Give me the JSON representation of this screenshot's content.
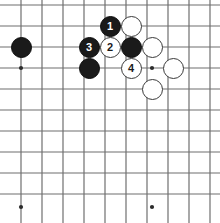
{
  "diagram": {
    "kind": "go-board-diagram",
    "title": "",
    "board": {
      "width_px": 220,
      "height_px": 223,
      "grid_spacing_px": 21,
      "stone_diameter_px": 21,
      "origin_x_px": 21,
      "origin_y_px": 5,
      "columns": 10,
      "rows": 10,
      "background_color": "#ffffff",
      "line_color": "#6f6f6f",
      "line_width_px": 1.2
    },
    "star_points": [
      {
        "name": "star-point-left",
        "cx": 21,
        "cy": 68
      },
      {
        "name": "star-point-center",
        "cx": 152,
        "cy": 68
      },
      {
        "name": "star-point-bottom-left",
        "cx": 21,
        "cy": 207
      },
      {
        "name": "star-point-bottom-center",
        "cx": 152,
        "cy": 207
      }
    ],
    "stones": [
      {
        "id": "b-left",
        "color": "black",
        "label": "",
        "cx": 21,
        "cy": 47
      },
      {
        "id": "b-1",
        "color": "black",
        "label": "1",
        "cx": 110,
        "cy": 26
      },
      {
        "id": "w-top-right",
        "color": "white",
        "label": "",
        "cx": 131,
        "cy": 26
      },
      {
        "id": "b-3",
        "color": "black",
        "label": "3",
        "cx": 89,
        "cy": 47
      },
      {
        "id": "w-2",
        "color": "white",
        "label": "2",
        "cx": 110,
        "cy": 47
      },
      {
        "id": "b-mid",
        "color": "black",
        "label": "",
        "cx": 131,
        "cy": 47
      },
      {
        "id": "w-mid-right",
        "color": "white",
        "label": "",
        "cx": 152,
        "cy": 47
      },
      {
        "id": "b-lower",
        "color": "black",
        "label": "",
        "cx": 89,
        "cy": 68
      },
      {
        "id": "w-4",
        "color": "white",
        "label": "4",
        "cx": 131,
        "cy": 68
      },
      {
        "id": "w-right",
        "color": "white",
        "label": "",
        "cx": 173,
        "cy": 68
      },
      {
        "id": "w-bottom",
        "color": "white",
        "label": "",
        "cx": 152,
        "cy": 89
      }
    ],
    "move_labels": [
      "1",
      "2",
      "3",
      "4"
    ],
    "colors": {
      "black_stone": "#1a1a1a",
      "white_stone": "#ffffff",
      "white_stone_border": "#3a3a3a",
      "grid_line": "#6f6f6f",
      "black_stone_label": "#ffffff",
      "white_stone_label": "#1a1a1a"
    }
  }
}
